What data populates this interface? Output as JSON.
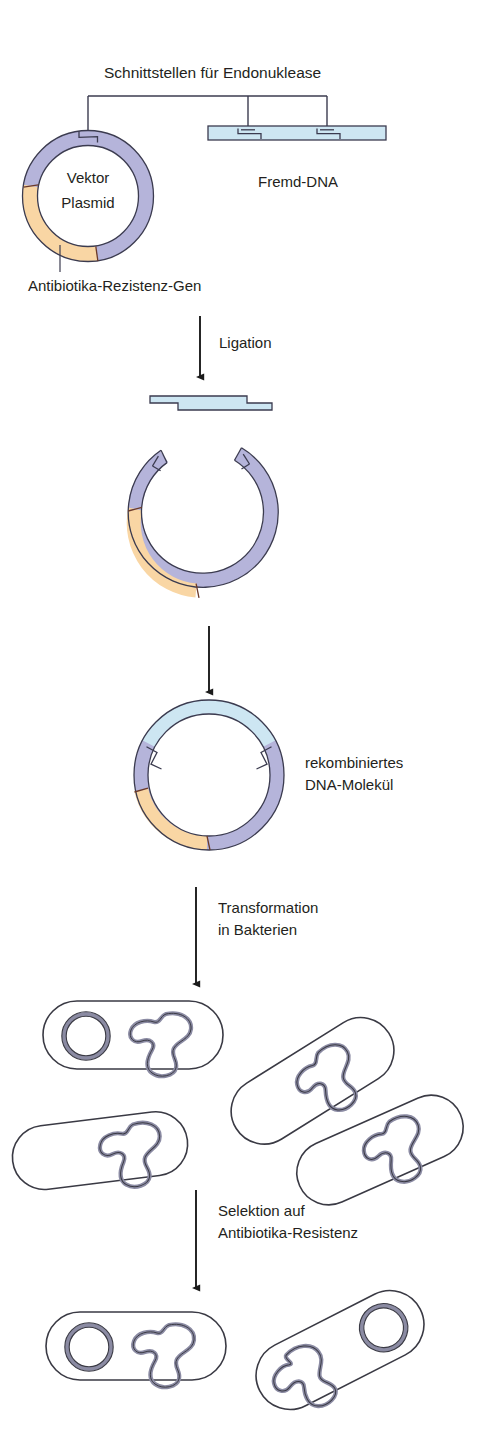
{
  "figure": {
    "title": "Schnittstellen für Endonuklease",
    "language": "de"
  },
  "labels": {
    "endonuclease_sites": "Schnittstellen für Endonuklease",
    "vector_line1": "Vektor",
    "vector_line2": "Plasmid",
    "antibiotic_resistance_gene": "Antibiotika-Rezistenz-Gen",
    "foreign_dna": "Fremd-DNA",
    "ligation": "Ligation",
    "recombinant_line1": "rekombiniertes",
    "recombinant_line2": "DNA-Molekül",
    "transformation_line1": "Transformation",
    "transformation_line2": "in Bakterien",
    "selection_line1": "Selektion auf",
    "selection_line2": "Antibiotika-Resistenz"
  },
  "colors": {
    "vector_backbone": "#b5b4da",
    "resistance_gene": "#f9d6a4",
    "foreign_dna": "#cde6f2",
    "outline": "#3b3b4f",
    "text": "#231f20",
    "background": "#ffffff",
    "cell_outline": "#3a3a44",
    "chromosome": "#8b8ba3"
  },
  "steps": [
    {
      "id": "step-1",
      "name": "cut-vector-and-foreign-dna",
      "caption": "Schnittstellen für Endonuklease"
    },
    {
      "id": "step-2",
      "name": "ligation",
      "caption": "Ligation"
    },
    {
      "id": "step-3",
      "name": "recombinant-dna-molecule",
      "caption": "rekombiniertes DNA-Molekül"
    },
    {
      "id": "step-4",
      "name": "transformation-into-bacteria",
      "caption": "Transformation in Bakterien"
    },
    {
      "id": "step-5",
      "name": "selection-on-antibiotic-resistance",
      "caption": "Selektion auf Antibiotika-Resistenz"
    }
  ],
  "bacteria": {
    "after_transformation_count": 4,
    "after_transformation_with_plasmid": 1,
    "after_selection_count": 2,
    "after_selection_with_plasmid": 2
  }
}
